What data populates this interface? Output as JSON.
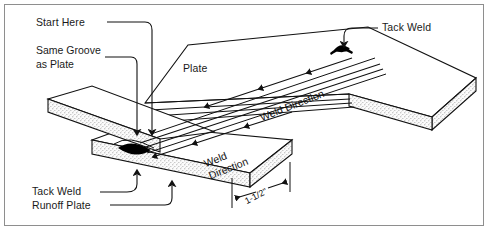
{
  "diagram": {
    "type": "technical-illustration",
    "background_color": "#ffffff",
    "border_color": "#8e8e8e",
    "line_color": "#111111",
    "weld_fill_color": "#000000",
    "plate_edge_fill": "#f2f2f2",
    "labels": {
      "start_here": "Start Here",
      "same_groove_line1": "Same Groove",
      "same_groove_line2": "as Plate",
      "plate": "Plate",
      "tack_weld_top": "Tack Weld",
      "tack_weld_bottom": "Tack Weld",
      "runoff_plate": "Runoff Plate",
      "weld_direction_upper": "Weld Direction",
      "weld_direction_lower_line1": "Weld",
      "weld_direction_lower_line2": "Direction",
      "dimension": "1-1/2\""
    }
  }
}
